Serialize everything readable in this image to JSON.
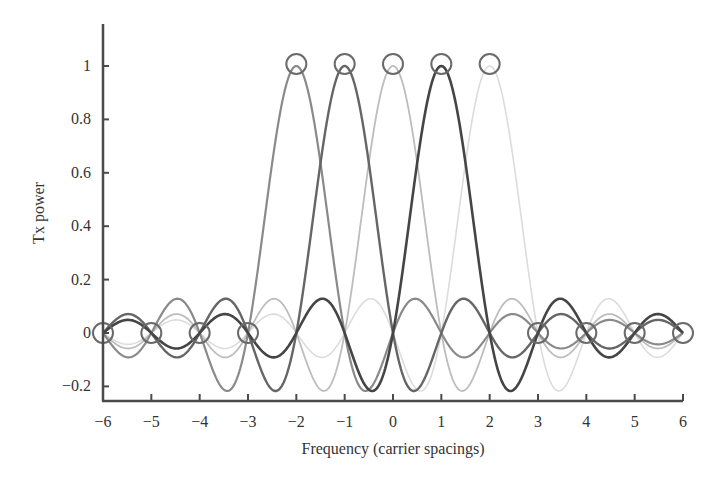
{
  "chart_data": {
    "type": "line",
    "title": "",
    "xlabel": "Frequency (carrier spacings)",
    "ylabel": "Tx power",
    "xlim": [
      -6,
      6
    ],
    "ylim": [
      -0.25,
      1.15
    ],
    "xticks": [
      -6,
      -5,
      -4,
      -3,
      -2,
      -1,
      0,
      1,
      2,
      3,
      4,
      5,
      6
    ],
    "xtick_labels": [
      "−6",
      "−5",
      "−4",
      "−3",
      "−2",
      "−1",
      "0",
      "1",
      "2",
      "3",
      "4",
      "5",
      "6"
    ],
    "yticks": [
      -0.2,
      0,
      0.2,
      0.4,
      0.6,
      0.8,
      1
    ],
    "ytick_labels": [
      "−0.2",
      "0",
      "0.2",
      "0.4",
      "0.6",
      "0.8",
      "1"
    ],
    "grid": false,
    "legend": null,
    "function": "sinc: sin(pi*(f-k))/(pi*(f-k))",
    "series": [
      {
        "name": "subcarrier -2",
        "center": -2,
        "color": "#8a8a8a",
        "width": 2.2
      },
      {
        "name": "subcarrier -1",
        "center": -1,
        "color": "#666666",
        "width": 2.4
      },
      {
        "name": "subcarrier 0",
        "center": 0,
        "color": "#bdbdbd",
        "width": 1.8
      },
      {
        "name": "subcarrier 1",
        "center": 1,
        "color": "#454545",
        "width": 2.6
      },
      {
        "name": "subcarrier 2",
        "center": 2,
        "color": "#dcdcdc",
        "width": 1.6
      }
    ],
    "markers": {
      "shape": "circle",
      "color": "#6a6a6a",
      "peaks": [
        [
          -2,
          1
        ],
        [
          -1,
          1
        ],
        [
          0,
          1
        ],
        [
          1,
          1
        ],
        [
          2,
          1
        ]
      ],
      "zeros": [
        [
          -6,
          0
        ],
        [
          -5,
          0
        ],
        [
          -4,
          0
        ],
        [
          -3,
          0
        ],
        [
          3,
          0
        ],
        [
          4,
          0
        ],
        [
          5,
          0
        ],
        [
          6,
          0
        ]
      ]
    },
    "annotations": []
  },
  "layout": {
    "x_px": [
      103,
      683
    ],
    "y_zero_px": 333,
    "y_one_px": 66,
    "axis_top_px": 24,
    "axis_bottom_px": 401,
    "axis_color": "#4a4a4a"
  }
}
